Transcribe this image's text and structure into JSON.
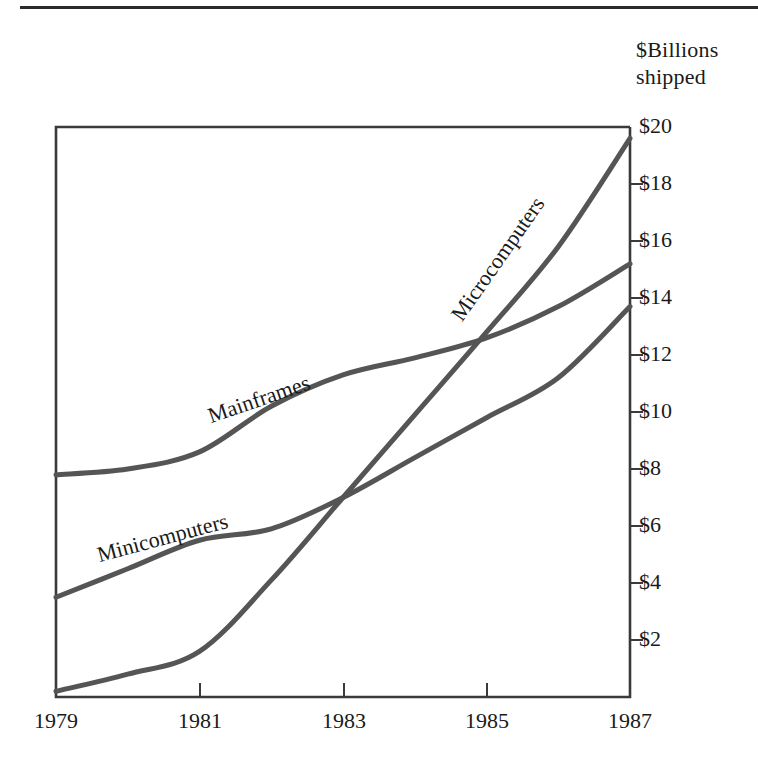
{
  "figure": {
    "axis_title_line1": "$Billions",
    "axis_title_line2": "shipped",
    "line_color": "#555555",
    "axis_color": "#3a3a3a",
    "text_color": "#1a1a1a",
    "background": "#ffffff"
  },
  "chart_data": {
    "type": "line",
    "title": "",
    "subtitle": "",
    "xlabel": "",
    "ylabel": "$Billions shipped",
    "xlim": [
      1979,
      1987
    ],
    "ylim": [
      0,
      20
    ],
    "xticks": [
      "1979",
      "1981",
      "1983",
      "1985",
      "1987"
    ],
    "xtick_values": [
      1979,
      1981,
      1983,
      1985,
      1987
    ],
    "yticks": [
      "$2",
      "$4",
      "$6",
      "$8",
      "$10",
      "$12",
      "$14",
      "$16",
      "$18",
      "$20"
    ],
    "ytick_values": [
      2,
      4,
      6,
      8,
      10,
      12,
      14,
      16,
      18,
      20
    ],
    "grid": false,
    "legend": "inline-labels",
    "x": [
      1979,
      1980,
      1981,
      1982,
      1983,
      1984,
      1985,
      1986,
      1987
    ],
    "series": [
      {
        "name": "Mainframes",
        "label": "Mainframes",
        "values": [
          7.8,
          8.0,
          8.6,
          10.2,
          11.3,
          11.9,
          12.6,
          13.7,
          15.2
        ]
      },
      {
        "name": "Minicomputers",
        "label": "Minicomputers",
        "values": [
          3.5,
          4.5,
          5.5,
          5.9,
          7.0,
          8.4,
          9.8,
          11.2,
          13.7
        ]
      },
      {
        "name": "Microcomputers",
        "label": "Microcomputers",
        "values": [
          0.2,
          0.8,
          1.6,
          4.1,
          7.0,
          9.9,
          12.8,
          15.8,
          19.6
        ]
      }
    ],
    "annotations": [
      "Microcomputers overtake Minicomputers in early 1983",
      "Microcomputers overtake Mainframes in late 1984"
    ]
  }
}
